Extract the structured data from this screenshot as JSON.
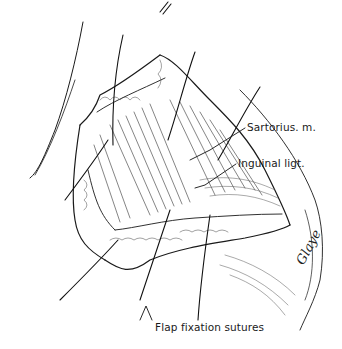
{
  "figure": {
    "type": "surgical illustration",
    "style": "black ink line drawing",
    "colors": {
      "ink": "#1a1a1a",
      "background": "#ffffff"
    }
  },
  "labels": [
    {
      "id": "sartorius",
      "text": "Sartorius. m."
    },
    {
      "id": "inguinal",
      "text": "Inguinal ligt."
    },
    {
      "id": "flap",
      "text": "Flap fixation sutures"
    }
  ],
  "signature": {
    "text": "Glaye"
  }
}
